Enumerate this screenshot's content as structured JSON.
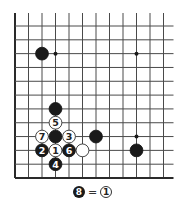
{
  "board": {
    "columns": 12,
    "rows": 12,
    "origin_x": 15,
    "origin_y": 26,
    "spacing_x": 13.5,
    "spacing_y": 13.82,
    "open_top": true,
    "open_right": true,
    "edge_left": true,
    "edge_bottom": true,
    "line_color": "#4a4a4a",
    "edge_color": "#2a2a2a",
    "black_color": "#1a1a1a",
    "white_color": "#ffffff"
  },
  "hoshi": [
    {
      "col": 3,
      "row": 2
    },
    {
      "col": 9,
      "row": 2
    },
    {
      "col": 9,
      "row": 8
    }
  ],
  "stones": [
    {
      "color": "black",
      "col": 2,
      "row": 2,
      "label": ""
    },
    {
      "color": "black",
      "col": 3,
      "row": 6,
      "label": ""
    },
    {
      "color": "white",
      "col": 3,
      "row": 7,
      "label": "5"
    },
    {
      "color": "white",
      "col": 2,
      "row": 8,
      "label": "7"
    },
    {
      "color": "black",
      "col": 3,
      "row": 8,
      "label": ""
    },
    {
      "color": "white",
      "col": 4,
      "row": 8,
      "label": "3"
    },
    {
      "color": "black",
      "col": 6,
      "row": 8,
      "label": ""
    },
    {
      "color": "black",
      "col": 2,
      "row": 9,
      "label": "2"
    },
    {
      "color": "white",
      "col": 3,
      "row": 9,
      "label": "1"
    },
    {
      "color": "black",
      "col": 4,
      "row": 9,
      "label": "6"
    },
    {
      "color": "white",
      "col": 5,
      "row": 9,
      "label": ""
    },
    {
      "color": "black",
      "col": 9,
      "row": 9,
      "label": ""
    },
    {
      "color": "black",
      "col": 3,
      "row": 10,
      "label": "4"
    }
  ],
  "caption": {
    "left_stone_color": "black",
    "left_label": "8",
    "equals": "=",
    "right_stone_color": "white",
    "right_label": "1"
  }
}
